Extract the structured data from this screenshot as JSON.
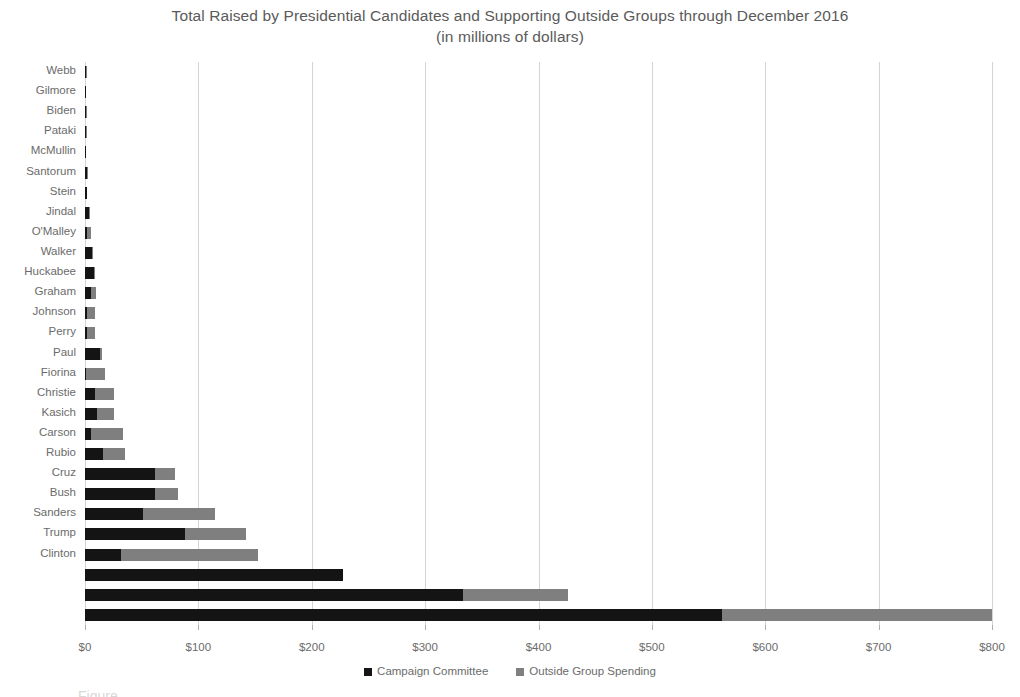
{
  "chart_data": {
    "type": "bar",
    "orientation": "horizontal",
    "stacked": true,
    "title": "Total Raised by Presidential Candidates and Supporting Outside Groups through December 2016",
    "subtitle": "(in millions of dollars)",
    "xlabel": "",
    "ylabel": "",
    "xlim": [
      0,
      800
    ],
    "xticks": [
      0,
      100,
      200,
      300,
      400,
      500,
      600,
      700,
      800
    ],
    "xtick_labels": [
      "$0",
      "$100",
      "$200",
      "$300",
      "$400",
      "$500",
      "$600",
      "$700",
      "$800"
    ],
    "grid": true,
    "legend_position": "bottom",
    "series": [
      {
        "name": "Campaign Committee",
        "color": "#141414",
        "values": [
          0.5,
          0.6,
          0.8,
          1.0,
          1.2,
          1.6,
          2.0,
          3.5,
          1.5,
          6.0,
          7.5,
          5.5,
          2.0,
          2.0,
          13.0,
          0.5,
          9.0,
          11.0,
          5.5,
          16.0,
          62.0,
          62.0,
          51.0,
          88.0,
          32.0,
          228.0,
          333.0,
          562.0
        ]
      },
      {
        "name": "Outside Group Spending",
        "color": "#7f7f7f",
        "values": [
          0.3,
          0.0,
          0.2,
          0.3,
          0.0,
          0.6,
          0.0,
          1.0,
          3.5,
          0.5,
          0.5,
          4.0,
          6.5,
          7.0,
          2.0,
          17.5,
          16.5,
          15.0,
          28.0,
          19.0,
          17.0,
          20.0,
          64.0,
          54.0,
          121.0,
          0.0,
          93.0,
          238.0
        ]
      }
    ],
    "categories": [
      "Webb",
      "Gilmore",
      "Biden",
      "Pataki",
      "McMullin",
      "Santorum",
      "Stein",
      "Jindal",
      "O'Malley",
      "Walker",
      "Huckabee",
      "Graham",
      "Johnson",
      "Perry",
      "Paul",
      "Fiorina",
      "Christie",
      "Kasich",
      "Carson",
      "Rubio",
      "Cruz",
      "Bush",
      "Sanders",
      "Trump",
      "Clinton",
      "",
      "",
      ""
    ]
  },
  "legend": {
    "items": [
      {
        "label": "Campaign Committee",
        "color": "#141414"
      },
      {
        "label": "Outside Group Spending",
        "color": "#7f7f7f"
      }
    ]
  },
  "caption": {
    "partial_text": "Figure"
  }
}
